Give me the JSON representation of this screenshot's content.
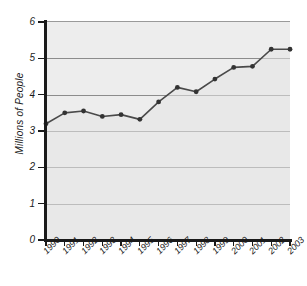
{
  "chart_data": {
    "type": "area",
    "title": "",
    "xlabel": "",
    "ylabel": "Millions of People",
    "categories": [
      "1990",
      "1991",
      "1992",
      "1993",
      "1994",
      "1995",
      "1996",
      "1997",
      "1998",
      "1999",
      "2000",
      "2001",
      "2002",
      "2003"
    ],
    "values": [
      3.2,
      3.5,
      3.55,
      3.4,
      3.45,
      3.32,
      3.8,
      4.2,
      4.08,
      4.43,
      4.75,
      4.78,
      5.25,
      5.25
    ],
    "series": [
      {
        "name": "People",
        "values": [
          3.2,
          3.5,
          3.55,
          3.4,
          3.45,
          3.32,
          3.8,
          4.2,
          4.08,
          4.43,
          4.75,
          4.78,
          5.25,
          5.25
        ]
      }
    ],
    "ylim": [
      0,
      6
    ],
    "yticks": [
      0,
      1,
      2,
      3,
      4,
      5,
      6
    ],
    "ytick_labels": [
      "0",
      "1",
      "2",
      "3",
      "4",
      "5",
      "6"
    ],
    "xlim": [
      "1990",
      "2003"
    ],
    "grid": true,
    "legend": "none",
    "marker": "filled-circle",
    "colors": {
      "line": "#4a4a4a",
      "marker": "#333333",
      "fill": "#ededed",
      "gridline": "#8c8c8c",
      "axis": "#1a1a1a",
      "text": "#1a1a1a"
    }
  }
}
